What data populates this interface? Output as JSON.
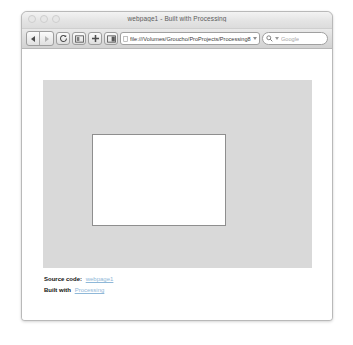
{
  "window": {
    "title": "webpage1 - Built with Processing",
    "traffic_lights": [
      "close-button",
      "minimize-button",
      "zoom-button"
    ]
  },
  "toolbar": {
    "back_label": "Back",
    "forward_label": "Forward",
    "reload_label": "Reload",
    "bookmark_label": "Show bookmarks",
    "add_label": "Add bookmark",
    "page_label": "Page actions",
    "url_value": "file:///Volumes/Groucho/ProProjects/Processing8",
    "url_placeholder": "Enter address",
    "search_placeholder": "Google",
    "search_value": ""
  },
  "page": {
    "source_code_label": "Source code:",
    "source_code_link": "webpage1",
    "built_with_label": "Built with",
    "built_with_link": "Processing",
    "canvas_name": "processing-canvas"
  },
  "colors": {
    "page_block": "#d9d9d9",
    "canvas": "#ffffff",
    "canvas_border": "#8e8e8e",
    "link": "#8fb8d8",
    "window_chrome": "#dddddd"
  }
}
